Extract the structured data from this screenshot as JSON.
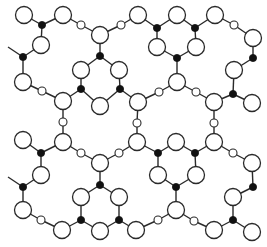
{
  "figure": {
    "colors": {
      "line": "#2a2a2a",
      "black_atom": "#111111",
      "background": "#ffffff"
    },
    "legend": {
      "large": "large open circle",
      "small": "small open circle",
      "black": "small filled circle"
    },
    "radius": {
      "large": 8.5,
      "small": 4,
      "black": 3.6
    },
    "nodes": [
      {
        "id": "n1",
        "x": 24,
        "y": 15,
        "t": "large"
      },
      {
        "id": "n2",
        "x": 63,
        "y": 15,
        "t": "large"
      },
      {
        "id": "n3",
        "x": 42,
        "y": 25,
        "t": "black"
      },
      {
        "id": "n4",
        "x": 41,
        "y": 45,
        "t": "large"
      },
      {
        "id": "n5",
        "x": 23,
        "y": 57,
        "t": "black"
      },
      {
        "id": "n6",
        "x": 23,
        "y": 82,
        "t": "large"
      },
      {
        "id": "n7",
        "x": 42,
        "y": 91,
        "t": "small"
      },
      {
        "id": "n8",
        "x": 63,
        "y": 101,
        "t": "large"
      },
      {
        "id": "n9",
        "x": 81,
        "y": 25,
        "t": "small"
      },
      {
        "id": "n10",
        "x": 100,
        "y": 35,
        "t": "large"
      },
      {
        "id": "n11",
        "x": 121,
        "y": 25,
        "t": "small"
      },
      {
        "id": "n12",
        "x": 138,
        "y": 15,
        "t": "large"
      },
      {
        "id": "n13",
        "x": 100,
        "y": 56,
        "t": "black"
      },
      {
        "id": "n14",
        "x": 81,
        "y": 70,
        "t": "large"
      },
      {
        "id": "n15",
        "x": 119,
        "y": 70,
        "t": "large"
      },
      {
        "id": "n16",
        "x": 81,
        "y": 89,
        "t": "black"
      },
      {
        "id": "n17",
        "x": 120,
        "y": 89,
        "t": "black"
      },
      {
        "id": "n18",
        "x": 100,
        "y": 106,
        "t": "large"
      },
      {
        "id": "n19",
        "x": 138,
        "y": 102,
        "t": "large"
      },
      {
        "id": "n20",
        "x": 157,
        "y": 28,
        "t": "black"
      },
      {
        "id": "n21",
        "x": 177,
        "y": 15,
        "t": "large"
      },
      {
        "id": "n22",
        "x": 195,
        "y": 28,
        "t": "black"
      },
      {
        "id": "n23",
        "x": 215,
        "y": 15,
        "t": "large"
      },
      {
        "id": "n24",
        "x": 234,
        "y": 25,
        "t": "small"
      },
      {
        "id": "n25",
        "x": 253,
        "y": 38,
        "t": "large"
      },
      {
        "id": "n26",
        "x": 253,
        "y": 58,
        "t": "black"
      },
      {
        "id": "n27",
        "x": 234,
        "y": 70,
        "t": "large"
      },
      {
        "id": "n28",
        "x": 233,
        "y": 94,
        "t": "black"
      },
      {
        "id": "n29",
        "x": 252,
        "y": 103,
        "t": "large"
      },
      {
        "id": "n30",
        "x": 157,
        "y": 47,
        "t": "large"
      },
      {
        "id": "n31",
        "x": 196,
        "y": 47,
        "t": "large"
      },
      {
        "id": "n32",
        "x": 177,
        "y": 58,
        "t": "black"
      },
      {
        "id": "n33",
        "x": 177,
        "y": 82,
        "t": "large"
      },
      {
        "id": "n34",
        "x": 159,
        "y": 92,
        "t": "small"
      },
      {
        "id": "n35",
        "x": 196,
        "y": 92,
        "t": "small"
      },
      {
        "id": "n36",
        "x": 214,
        "y": 102,
        "t": "large"
      },
      {
        "id": "n37",
        "x": 214,
        "y": 123,
        "t": "small"
      },
      {
        "id": "n38",
        "x": 214,
        "y": 142,
        "t": "large"
      },
      {
        "id": "n39",
        "x": 233,
        "y": 153,
        "t": "small"
      },
      {
        "id": "n40",
        "x": 252,
        "y": 163,
        "t": "large"
      },
      {
        "id": "n41",
        "x": 137,
        "y": 123,
        "t": "small"
      },
      {
        "id": "n42",
        "x": 137,
        "y": 142,
        "t": "large"
      },
      {
        "id": "n43",
        "x": 158,
        "y": 153,
        "t": "black"
      },
      {
        "id": "n44",
        "x": 176,
        "y": 142,
        "t": "large"
      },
      {
        "id": "n45",
        "x": 195,
        "y": 153,
        "t": "black"
      },
      {
        "id": "n46",
        "x": 158,
        "y": 175,
        "t": "large"
      },
      {
        "id": "n47",
        "x": 196,
        "y": 175,
        "t": "large"
      },
      {
        "id": "n48",
        "x": 176,
        "y": 187,
        "t": "black"
      },
      {
        "id": "n49",
        "x": 176,
        "y": 210,
        "t": "large"
      },
      {
        "id": "n50",
        "x": 158,
        "y": 220,
        "t": "small"
      },
      {
        "id": "n51",
        "x": 136,
        "y": 230,
        "t": "large"
      },
      {
        "id": "n52",
        "x": 194,
        "y": 221,
        "t": "small"
      },
      {
        "id": "n53",
        "x": 214,
        "y": 230,
        "t": "large"
      },
      {
        "id": "n54",
        "x": 233,
        "y": 220,
        "t": "black"
      },
      {
        "id": "n55",
        "x": 233,
        "y": 197,
        "t": "large"
      },
      {
        "id": "n56",
        "x": 253,
        "y": 187,
        "t": "black"
      },
      {
        "id": "n57",
        "x": 252,
        "y": 232,
        "t": "large"
      },
      {
        "id": "n58",
        "x": 63,
        "y": 122,
        "t": "small"
      },
      {
        "id": "n59",
        "x": 63,
        "y": 142,
        "t": "large"
      },
      {
        "id": "n60",
        "x": 23,
        "y": 140,
        "t": "large"
      },
      {
        "id": "n61",
        "x": 41,
        "y": 153,
        "t": "black"
      },
      {
        "id": "n62",
        "x": 41,
        "y": 175,
        "t": "large"
      },
      {
        "id": "n63",
        "x": 81,
        "y": 153,
        "t": "small"
      },
      {
        "id": "n64",
        "x": 119,
        "y": 153,
        "t": "small"
      },
      {
        "id": "n65",
        "x": 100,
        "y": 163,
        "t": "large"
      },
      {
        "id": "n66",
        "x": 100,
        "y": 185,
        "t": "black"
      },
      {
        "id": "n67",
        "x": 81,
        "y": 197,
        "t": "large"
      },
      {
        "id": "n68",
        "x": 119,
        "y": 197,
        "t": "large"
      },
      {
        "id": "n69",
        "x": 81,
        "y": 220,
        "t": "black"
      },
      {
        "id": "n70",
        "x": 119,
        "y": 220,
        "t": "black"
      },
      {
        "id": "n71",
        "x": 100,
        "y": 231,
        "t": "large"
      },
      {
        "id": "n72",
        "x": 62,
        "y": 230,
        "t": "large"
      },
      {
        "id": "n73",
        "x": 41,
        "y": 220,
        "t": "small"
      },
      {
        "id": "n74",
        "x": 23,
        "y": 210,
        "t": "large"
      },
      {
        "id": "n75",
        "x": 23,
        "y": 187,
        "t": "black"
      },
      {
        "id": "n76",
        "x": 8,
        "y": 47,
        "t": "end"
      },
      {
        "id": "n77",
        "x": 8,
        "y": 177,
        "t": "end"
      }
    ],
    "bonds": [
      [
        "n1",
        "n3"
      ],
      [
        "n2",
        "n3"
      ],
      [
        "n3",
        "n4"
      ],
      [
        "n4",
        "n5"
      ],
      [
        "n5",
        "n76"
      ],
      [
        "n5",
        "n6"
      ],
      [
        "n6",
        "n7"
      ],
      [
        "n7",
        "n8"
      ],
      [
        "n2",
        "n9"
      ],
      [
        "n9",
        "n10"
      ],
      [
        "n10",
        "n11"
      ],
      [
        "n11",
        "n12"
      ],
      [
        "n10",
        "n13"
      ],
      [
        "n13",
        "n14"
      ],
      [
        "n13",
        "n15"
      ],
      [
        "n14",
        "n16"
      ],
      [
        "n15",
        "n17"
      ],
      [
        "n16",
        "n8"
      ],
      [
        "n16",
        "n18"
      ],
      [
        "n17",
        "n18"
      ],
      [
        "n17",
        "n19"
      ],
      [
        "n12",
        "n20"
      ],
      [
        "n20",
        "n21"
      ],
      [
        "n21",
        "n22"
      ],
      [
        "n22",
        "n23"
      ],
      [
        "n23",
        "n24"
      ],
      [
        "n24",
        "n25"
      ],
      [
        "n25",
        "n26"
      ],
      [
        "n26",
        "n27"
      ],
      [
        "n27",
        "n28"
      ],
      [
        "n28",
        "n29"
      ],
      [
        "n28",
        "n36"
      ],
      [
        "n20",
        "n30"
      ],
      [
        "n22",
        "n31"
      ],
      [
        "n30",
        "n32"
      ],
      [
        "n31",
        "n32"
      ],
      [
        "n32",
        "n33"
      ],
      [
        "n33",
        "n34"
      ],
      [
        "n33",
        "n35"
      ],
      [
        "n34",
        "n19"
      ],
      [
        "n35",
        "n36"
      ],
      [
        "n36",
        "n37"
      ],
      [
        "n37",
        "n38"
      ],
      [
        "n38",
        "n39"
      ],
      [
        "n39",
        "n40"
      ],
      [
        "n19",
        "n41"
      ],
      [
        "n41",
        "n42"
      ],
      [
        "n42",
        "n43"
      ],
      [
        "n43",
        "n44"
      ],
      [
        "n44",
        "n45"
      ],
      [
        "n45",
        "n38"
      ],
      [
        "n43",
        "n46"
      ],
      [
        "n45",
        "n47"
      ],
      [
        "n46",
        "n48"
      ],
      [
        "n47",
        "n48"
      ],
      [
        "n48",
        "n49"
      ],
      [
        "n49",
        "n50"
      ],
      [
        "n50",
        "n51"
      ],
      [
        "n49",
        "n52"
      ],
      [
        "n52",
        "n53"
      ],
      [
        "n53",
        "n54"
      ],
      [
        "n54",
        "n55"
      ],
      [
        "n55",
        "n56"
      ],
      [
        "n56",
        "n40"
      ],
      [
        "n54",
        "n57"
      ],
      [
        "n8",
        "n58"
      ],
      [
        "n58",
        "n59"
      ],
      [
        "n60",
        "n61"
      ],
      [
        "n61",
        "n59"
      ],
      [
        "n61",
        "n62"
      ],
      [
        "n59",
        "n63"
      ],
      [
        "n63",
        "n65"
      ],
      [
        "n65",
        "n64"
      ],
      [
        "n64",
        "n42"
      ],
      [
        "n65",
        "n66"
      ],
      [
        "n66",
        "n67"
      ],
      [
        "n66",
        "n68"
      ],
      [
        "n67",
        "n69"
      ],
      [
        "n68",
        "n70"
      ],
      [
        "n69",
        "n71"
      ],
      [
        "n70",
        "n71"
      ],
      [
        "n70",
        "n51"
      ],
      [
        "n69",
        "n72"
      ],
      [
        "n72",
        "n73"
      ],
      [
        "n73",
        "n74"
      ],
      [
        "n74",
        "n75"
      ],
      [
        "n75",
        "n62"
      ],
      [
        "n75",
        "n77"
      ]
    ]
  }
}
